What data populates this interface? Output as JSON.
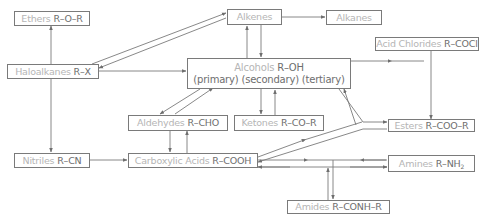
{
  "diagram": {
    "type": "organic-chemistry-reaction-map",
    "colors": {
      "box_border": "#7a7a7a",
      "name_text": "#b5b5b5",
      "formula_text": "#6e6e6e",
      "arrow": "#6e6e6e"
    },
    "nodes": {
      "ethers": {
        "name": "Ethers",
        "formula": "R–O–R"
      },
      "haloalkanes": {
        "name": "Haloalkanes",
        "formula": "R–X"
      },
      "alkenes": {
        "name": "Alkenes",
        "formula": ""
      },
      "alkanes": {
        "name": "Alkanes",
        "formula": ""
      },
      "alcohols": {
        "name": "Alcohols",
        "formula": "R–OH",
        "subtitle": "(primary) (secondary) (tertiary)"
      },
      "acid_chlorides": {
        "name": "Acid Chlorides",
        "formula": "R–COCl"
      },
      "aldehydes": {
        "name": "Aldehydes",
        "formula": "R–CHO"
      },
      "ketones": {
        "name": "Ketones",
        "formula": "R–CO–R"
      },
      "esters": {
        "name": "Esters",
        "formula": "R–COO–R"
      },
      "nitriles": {
        "name": "Nitriles",
        "formula": "R–CN"
      },
      "carboxylic_acids": {
        "name": "Carboxylic Acids",
        "formula": "R–COOH"
      },
      "amines": {
        "name": "Amines",
        "formula": "R–NH",
        "formula_sub": "2"
      },
      "amides": {
        "name": "Amides",
        "formula": "R–CONH–R"
      }
    },
    "edges": [
      {
        "from": "haloalkanes",
        "to": "ethers"
      },
      {
        "from": "haloalkanes",
        "to": "alkenes"
      },
      {
        "from": "alkenes",
        "to": "haloalkanes"
      },
      {
        "from": "haloalkanes",
        "to": "alcohols"
      },
      {
        "from": "haloalkanes",
        "to": "nitriles"
      },
      {
        "from": "alkenes",
        "to": "alkanes"
      },
      {
        "from": "alkenes",
        "to": "alcohols"
      },
      {
        "from": "alcohols",
        "to": "alkenes"
      },
      {
        "from": "alcohols",
        "to": "acid_chlorides"
      },
      {
        "from": "alcohols",
        "to": "aldehydes"
      },
      {
        "from": "aldehydes",
        "to": "alcohols"
      },
      {
        "from": "alcohols",
        "to": "ketones"
      },
      {
        "from": "ketones",
        "to": "alcohols"
      },
      {
        "from": "alcohols",
        "to": "esters"
      },
      {
        "from": "esters",
        "to": "alcohols"
      },
      {
        "from": "acid_chlorides",
        "to": "esters"
      },
      {
        "from": "aldehydes",
        "to": "carboxylic_acids"
      },
      {
        "from": "carboxylic_acids",
        "to": "aldehydes"
      },
      {
        "from": "nitriles",
        "to": "carboxylic_acids"
      },
      {
        "from": "carboxylic_acids",
        "to": "esters"
      },
      {
        "from": "esters",
        "to": "carboxylic_acids"
      },
      {
        "from": "carboxylic_acids",
        "to": "amines"
      },
      {
        "from": "amines",
        "to": "carboxylic_acids"
      },
      {
        "from": "carboxylic_acids",
        "to": "amides"
      },
      {
        "from": "amides",
        "to": "carboxylic_acids"
      }
    ]
  }
}
